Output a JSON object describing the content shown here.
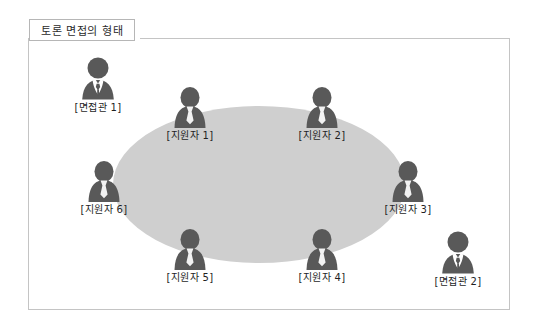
{
  "title": {
    "text": "토론 면접의 형태"
  },
  "diagram": {
    "table_shape": "ellipse",
    "table_color": "#cfcfcf",
    "frame_border_color": "#c4c4c4",
    "figure_color": "#595959",
    "people": [
      {
        "label": "[면접관 1]",
        "role": "interviewer",
        "icon": "interviewer-figure-icon",
        "x": 61,
        "y": 56
      },
      {
        "label": "[지원자 1]",
        "role": "applicant",
        "icon": "applicant-figure-icon",
        "x": 153,
        "y": 86
      },
      {
        "label": "[지원자 2]",
        "role": "applicant",
        "icon": "applicant-figure-icon",
        "x": 285,
        "y": 86
      },
      {
        "label": "[지원자 3]",
        "role": "applicant",
        "icon": "applicant-figure-icon",
        "x": 371,
        "y": 160
      },
      {
        "label": "[지원자 4]",
        "role": "applicant",
        "icon": "applicant-figure-icon",
        "x": 285,
        "y": 228
      },
      {
        "label": "[지원자 5]",
        "role": "applicant",
        "icon": "applicant-figure-icon",
        "x": 153,
        "y": 228
      },
      {
        "label": "[지원자 6]",
        "role": "applicant",
        "icon": "applicant-figure-icon",
        "x": 67,
        "y": 160
      },
      {
        "label": "[면접관 2]",
        "role": "interviewer",
        "icon": "interviewer-figure-icon",
        "x": 421,
        "y": 230
      }
    ]
  }
}
